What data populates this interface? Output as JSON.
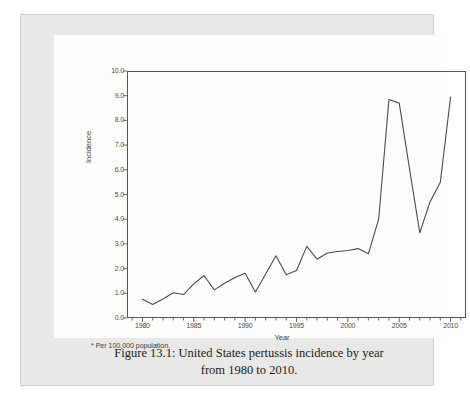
{
  "figure": {
    "caption_line_1": "Figure 13.1: United States pertussis incidence by year",
    "caption_line_2": "from 1980 to 2010.",
    "footnote": "* Per 100,000 population."
  },
  "chart_data": {
    "type": "line",
    "title": "",
    "xlabel": "Year",
    "ylabel": "Incidence",
    "xlim": [
      1978.5,
      2011.5
    ],
    "ylim": [
      0.0,
      10.0
    ],
    "grid": false,
    "legend": null,
    "line_color": "#4c4c4c",
    "x": [
      1980,
      1981,
      1982,
      1983,
      1984,
      1985,
      1986,
      1987,
      1988,
      1989,
      1990,
      1991,
      1992,
      1993,
      1994,
      1995,
      1996,
      1997,
      1998,
      1999,
      2000,
      2001,
      2002,
      2003,
      2004,
      2005,
      2006,
      2007,
      2008,
      2009,
      2010
    ],
    "values": [
      0.76,
      0.55,
      0.77,
      1.02,
      0.95,
      1.38,
      1.72,
      1.14,
      1.41,
      1.64,
      1.81,
      1.05,
      1.78,
      2.52,
      1.75,
      1.92,
      2.9,
      2.38,
      2.63,
      2.69,
      2.73,
      2.81,
      2.6,
      4.0,
      8.85,
      8.7,
      6.05,
      3.45,
      4.7,
      5.5,
      8.95
    ],
    "xticks": [
      1980,
      1985,
      1990,
      1995,
      2000,
      2005,
      2010
    ],
    "xtick_labels": [
      "1980",
      "1985",
      "1990",
      "1995",
      "2000",
      "2005",
      "2010"
    ],
    "xminor_step": 1,
    "yticks": [
      0.0,
      1.0,
      2.0,
      3.0,
      4.0,
      5.0,
      6.0,
      7.0,
      8.0,
      9.0,
      10.0
    ],
    "ytick_labels": [
      "0.0",
      "1.0",
      "2.0",
      "3.0",
      "4.0",
      "5.0",
      "6.0",
      "7.0",
      "8.0",
      "9.0",
      "10.0"
    ]
  }
}
